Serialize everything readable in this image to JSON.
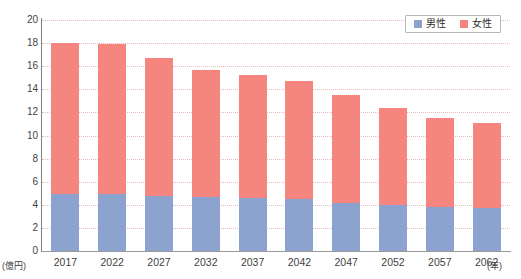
{
  "chart_data": {
    "type": "bar",
    "stacked": true,
    "title": "",
    "subtitle": "",
    "xlabel": "(年)",
    "ylabel": "(億円)",
    "ylim": [
      0,
      20
    ],
    "ytick_step": 2,
    "yticks": [
      "20",
      "18",
      "16",
      "14",
      "12",
      "10",
      "8",
      "6",
      "4",
      "2",
      "0"
    ],
    "grid": true,
    "legend_position": "top-right",
    "categories": [
      "2017",
      "2022",
      "2027",
      "2032",
      "2037",
      "2042",
      "2047",
      "2052",
      "2057",
      "2062"
    ],
    "series": [
      {
        "name": "男性",
        "color": "#8CA3CF",
        "values": [
          4.9,
          4.9,
          4.8,
          4.7,
          4.6,
          4.5,
          4.2,
          4.0,
          3.8,
          3.7
        ]
      },
      {
        "name": "女性",
        "color": "#F4867F",
        "values": [
          13.1,
          13.0,
          11.9,
          11.0,
          10.6,
          10.2,
          9.3,
          8.4,
          7.7,
          7.4
        ]
      }
    ],
    "totals": [
      18.0,
      17.9,
      16.7,
      15.7,
      15.2,
      14.7,
      13.5,
      12.4,
      11.5,
      11.1
    ]
  },
  "axes": {
    "y_unit_label": "(億円)",
    "x_unit_label": "(年)"
  },
  "legend": {
    "items": [
      {
        "label": "男性",
        "color": "#8CA3CF"
      },
      {
        "label": "女性",
        "color": "#F4867F"
      }
    ]
  },
  "colors": {
    "male": "#8CA3CF",
    "female": "#F4867F",
    "grid": "#e6b9ba",
    "axis": "#808080",
    "text": "#3f3f3f",
    "background": "#ffffff"
  }
}
